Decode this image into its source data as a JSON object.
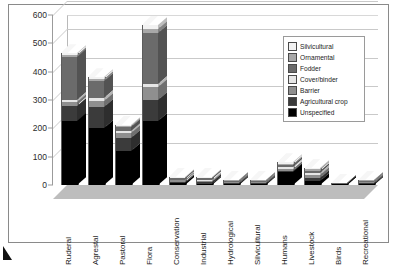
{
  "chart_data": {
    "type": "bar",
    "stacked": true,
    "three_d": true,
    "title": "",
    "xlabel": "",
    "ylabel": "",
    "ylim": [
      0,
      600
    ],
    "yticks": [
      0,
      100,
      200,
      300,
      400,
      500,
      600
    ],
    "grid": true,
    "legend_position": "inside-top-right",
    "categories": [
      "Ruderal",
      "Agrestal",
      "Pastoral",
      "Flora",
      "Conservation",
      "Industrial",
      "Hydrological",
      "Silvicultural",
      "Humans",
      "Livestock",
      "Birds",
      "Recreational"
    ],
    "series": [
      {
        "name": "Unspecified",
        "color": "#000000",
        "values": [
          225,
          200,
          120,
          225,
          6,
          4,
          3,
          3,
          45,
          14,
          2,
          4
        ]
      },
      {
        "name": "Agricultural crop",
        "color": "#3b3b3b",
        "values": [
          55,
          75,
          45,
          75,
          5,
          6,
          4,
          4,
          6,
          12,
          1,
          3
        ]
      },
      {
        "name": "Barrier",
        "color": "#8f8f8f",
        "values": [
          12,
          22,
          18,
          45,
          5,
          5,
          3,
          3,
          7,
          10,
          1,
          3
        ]
      },
      {
        "name": "Cover/binder",
        "color": "#e6e6e6",
        "values": [
          8,
          10,
          6,
          12,
          3,
          4,
          2,
          2,
          4,
          6,
          1,
          2
        ]
      },
      {
        "name": "Fodder",
        "color": "#6b6b6b",
        "values": [
          150,
          60,
          16,
          180,
          4,
          4,
          3,
          3,
          8,
          8,
          1,
          3
        ]
      },
      {
        "name": "Ornamental",
        "color": "#a8a8a8",
        "values": [
          10,
          8,
          4,
          15,
          3,
          3,
          2,
          2,
          5,
          5,
          1,
          2
        ]
      },
      {
        "name": "Silvicultural",
        "color": "#f2f2f2",
        "values": [
          5,
          5,
          3,
          13,
          2,
          2,
          2,
          2,
          5,
          5,
          1,
          2
        ]
      }
    ],
    "totals": [
      465,
      380,
      212,
      565,
      28,
      28,
      19,
      19,
      80,
      60,
      8,
      19
    ]
  },
  "legend": {
    "items": [
      {
        "label": "Silvicultural",
        "swatch": "#f2f2f2"
      },
      {
        "label": "Ornamental",
        "swatch": "#a8a8a8"
      },
      {
        "label": "Fodder",
        "swatch": "#6b6b6b"
      },
      {
        "label": "Cover/binder",
        "swatch": "#e6e6e6"
      },
      {
        "label": "Barrier",
        "swatch": "#8f8f8f"
      },
      {
        "label": "Agricultural crop",
        "swatch": "#3b3b3b"
      },
      {
        "label": "Unspecified",
        "swatch": "#000000"
      }
    ]
  }
}
